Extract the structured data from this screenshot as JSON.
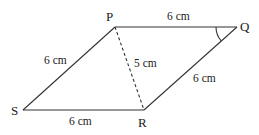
{
  "diagram": {
    "type": "parallelogram",
    "vertices": {
      "P": {
        "label": "P",
        "x": 115,
        "y": 27
      },
      "Q": {
        "label": "Q",
        "x": 237,
        "y": 27
      },
      "R": {
        "label": "R",
        "x": 144,
        "y": 110
      },
      "S": {
        "label": "S",
        "x": 23,
        "y": 110
      }
    },
    "edges": [
      {
        "from": "P",
        "to": "Q",
        "label": "6 cm",
        "style": "solid"
      },
      {
        "from": "Q",
        "to": "R",
        "label": "6 cm",
        "style": "solid"
      },
      {
        "from": "R",
        "to": "S",
        "label": "6 cm",
        "style": "solid"
      },
      {
        "from": "S",
        "to": "P",
        "label": "6 cm",
        "style": "solid"
      },
      {
        "from": "P",
        "to": "R",
        "label": "5 cm",
        "style": "dashed"
      }
    ],
    "angle_marks": [
      {
        "vertex": "Q",
        "type": "arc"
      }
    ],
    "colors": {
      "line": "#333333",
      "text": "#222222",
      "background": "#ffffff"
    }
  }
}
